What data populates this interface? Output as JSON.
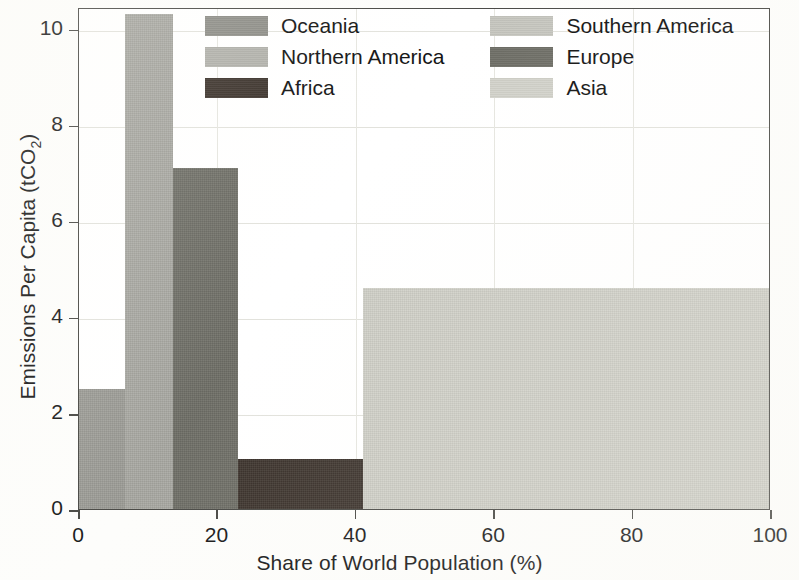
{
  "chart_data": {
    "type": "bar",
    "variant": "marimekko-variable-width",
    "title": "",
    "xlabel": "Share of World Population (%)",
    "ylabel": "Emissions Per Capita (tCO2)",
    "ylabel_display": "Emissions Per Capita (tCO",
    "ylabel_sub": "2",
    "ylabel_tail": ")",
    "xlim": [
      0,
      100
    ],
    "ylim": [
      0,
      10.45
    ],
    "xticks": [
      0,
      20,
      40,
      60,
      80,
      100
    ],
    "xticklabels": [
      "0",
      "20",
      "40",
      "60",
      "80",
      "100"
    ],
    "yticks": [
      0,
      2,
      4,
      6,
      8,
      10
    ],
    "yticklabels": [
      "0",
      "2",
      "4",
      "6",
      "8",
      "10"
    ],
    "grid": true,
    "legend_position": "upper-center",
    "categories": [
      "Oceania",
      "Northern America",
      "Europe",
      "Africa",
      "Asia"
    ],
    "values": [
      2.5,
      10.3,
      7.1,
      1.05,
      4.6
    ],
    "widths": [
      6.6,
      7.0,
      9.4,
      18.0,
      59.0
    ],
    "x_starts": [
      0,
      6.6,
      13.6,
      23.0,
      41.0
    ],
    "x_ends": [
      6.6,
      13.6,
      23.0,
      41.0,
      100.0
    ],
    "bars": [
      {
        "name": "Oceania",
        "x_start": 0,
        "x_end": 6.6,
        "width": 6.6,
        "value": 2.5,
        "color": "#9c9c96"
      },
      {
        "name": "Northern America",
        "x_start": 6.6,
        "x_end": 13.6,
        "width": 7.0,
        "value": 10.3,
        "color": "#a8a8a2"
      },
      {
        "name": "Europe",
        "x_start": 13.6,
        "x_end": 23.0,
        "width": 9.4,
        "value": 7.1,
        "color": "#6e6e66"
      },
      {
        "name": "Africa",
        "x_start": 23.0,
        "x_end": 41.0,
        "width": 18.0,
        "value": 1.05,
        "color": "#3b322b"
      },
      {
        "name": "Asia",
        "x_start": 41.0,
        "x_end": 100.0,
        "width": 59.0,
        "value": 4.6,
        "color": "#cfcfc7"
      }
    ],
    "legend": [
      {
        "label": "Oceania",
        "color": "#8e8e88",
        "column": "left",
        "row": 1
      },
      {
        "label": "Northern America",
        "color": "#b2b2ac",
        "column": "left",
        "row": 2
      },
      {
        "label": "Africa",
        "color": "#3b322b",
        "column": "left",
        "row": 3
      },
      {
        "label": "Southern America",
        "color": "#c6c6bf",
        "column": "right",
        "row": 1
      },
      {
        "label": "Europe",
        "color": "#6e6e66",
        "column": "right",
        "row": 2
      },
      {
        "label": "Asia",
        "color": "#d2d2ca",
        "column": "right",
        "row": 3
      }
    ],
    "colors": {
      "axis": "#4a4a46",
      "grid": "#e2e2dc",
      "plot_background": "#ffffff",
      "page_background": "#fdfdfb",
      "text": "#1b1b1b"
    }
  }
}
